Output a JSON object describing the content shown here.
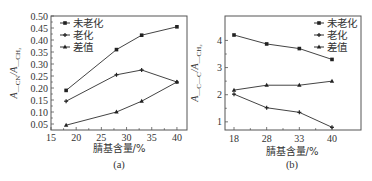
{
  "chart_data": [
    {
      "id": "a",
      "type": "line",
      "panel_label": "(a)",
      "title": "",
      "xlabel": "腈基含量/%",
      "ylabel": "A_CN/A_CH2",
      "ylabel_main": "A",
      "ylabel_sub1": "—CN",
      "ylabel_slash": "/A",
      "ylabel_sub2": "—CH₂",
      "x": [
        18,
        28,
        33,
        40
      ],
      "xlim": [
        15,
        42
      ],
      "ylim": [
        0.025,
        0.5
      ],
      "xticks": [
        "15",
        "20",
        "25",
        "30",
        "35",
        "40"
      ],
      "xtick_values": [
        15,
        20,
        25,
        30,
        35,
        40
      ],
      "yticks": [
        "0.05",
        "0.10",
        "0.15",
        "0.20",
        "0.25",
        "0.30",
        "0.35",
        "0.40",
        "0.45",
        "0.50"
      ],
      "ytick_values": [
        0.05,
        0.1,
        0.15,
        0.2,
        0.25,
        0.3,
        0.35,
        0.4,
        0.45,
        0.5
      ],
      "grid": false,
      "legend_position": "upper left",
      "series": [
        {
          "name": "未老化",
          "marker": "square",
          "values": [
            0.19,
            0.36,
            0.42,
            0.455
          ]
        },
        {
          "name": "老化",
          "marker": "star",
          "values": [
            0.145,
            0.255,
            0.275,
            0.225
          ]
        },
        {
          "name": "差值",
          "marker": "triangle",
          "values": [
            0.045,
            0.1,
            0.145,
            0.225
          ]
        }
      ]
    },
    {
      "id": "b",
      "type": "line",
      "panel_label": "(b)",
      "title": "",
      "xlabel": "腈基含量/%",
      "ylabel": "A_C=C/A_CH2",
      "ylabel_main": "A",
      "ylabel_sub1": "—C—C",
      "ylabel_slash": "/A",
      "ylabel_sub2": "—CH₂",
      "categories": [
        "18",
        "28",
        "33",
        "40"
      ],
      "ylim": [
        0.7,
        4.9
      ],
      "yticks": [
        "1",
        "2",
        "3",
        "4"
      ],
      "ytick_values": [
        1,
        2,
        3,
        4
      ],
      "grid": false,
      "legend_position": "upper right",
      "series": [
        {
          "name": "未老化",
          "marker": "square",
          "values": [
            4.2,
            3.87,
            3.7,
            3.3
          ]
        },
        {
          "name": "老化",
          "marker": "star",
          "values": [
            2.02,
            1.52,
            1.35,
            0.8
          ]
        },
        {
          "name": "差值",
          "marker": "triangle",
          "values": [
            2.17,
            2.35,
            2.35,
            2.5
          ]
        }
      ]
    }
  ]
}
